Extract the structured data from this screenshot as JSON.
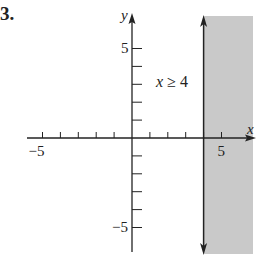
{
  "problem_number": "3.",
  "chart_data": {
    "type": "area",
    "title": "",
    "annotation": "x ≥ 4",
    "annotation_var": "x",
    "annotation_rest": " ≥ 4",
    "xlabel": "x",
    "ylabel": "y",
    "xlim": [
      -6,
      6.5
    ],
    "ylim": [
      -6.3,
      6.5
    ],
    "x_ticks": [
      -5,
      -4,
      -3,
      -2,
      -1,
      1,
      2,
      3,
      4,
      5
    ],
    "y_ticks": [
      -5,
      -4,
      -3,
      -2,
      -1,
      1,
      2,
      3,
      4,
      5
    ],
    "x_tick_labels": {
      "-5": "−5",
      "5": "5"
    },
    "y_tick_labels": {
      "5": "5",
      "-5": "−5"
    },
    "grid": false,
    "boundary": {
      "type": "vertical_line",
      "x": 4,
      "style": "solid",
      "arrows": "both"
    },
    "shaded_region": {
      "x_min": 4,
      "x_max": 6.5,
      "y_min": -6.3,
      "y_max": 6.4,
      "side": "right"
    },
    "colors": {
      "shade": "#c9c9c9",
      "axis": "#222222",
      "boundary": "#222222"
    }
  }
}
